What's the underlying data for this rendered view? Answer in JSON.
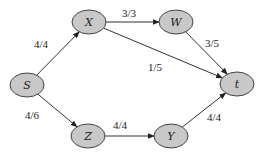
{
  "diagram": {
    "type": "flow-network",
    "nodes": [
      {
        "id": "S",
        "label": "S",
        "cx": 27,
        "cy": 85
      },
      {
        "id": "X",
        "label": "X",
        "cx": 89,
        "cy": 22
      },
      {
        "id": "W",
        "label": "W",
        "cx": 176,
        "cy": 22
      },
      {
        "id": "t",
        "label": "t",
        "cx": 237,
        "cy": 84
      },
      {
        "id": "Z",
        "label": "Z",
        "cx": 88,
        "cy": 136
      },
      {
        "id": "Y",
        "label": "Y",
        "cx": 171,
        "cy": 136
      }
    ],
    "edges": [
      {
        "from": "S",
        "to": "X",
        "label": "4/4",
        "lx": 34,
        "ly": 48
      },
      {
        "from": "X",
        "to": "W",
        "label": "3/3",
        "lx": 122,
        "ly": 17
      },
      {
        "from": "X",
        "to": "t",
        "label": "1/5",
        "lx": 148,
        "ly": 71
      },
      {
        "from": "W",
        "to": "t",
        "label": "3/5",
        "lx": 205,
        "ly": 47
      },
      {
        "from": "S",
        "to": "Z",
        "label": "4/6",
        "lx": 25,
        "ly": 119
      },
      {
        "from": "Z",
        "to": "Y",
        "label": "4/4",
        "lx": 113,
        "ly": 129
      },
      {
        "from": "Y",
        "to": "t",
        "label": "4/4",
        "lx": 207,
        "ly": 121
      }
    ]
  },
  "colors": {
    "node_fill": "#c8c8c8",
    "node_stroke": "#444444",
    "edge": "#333333"
  }
}
